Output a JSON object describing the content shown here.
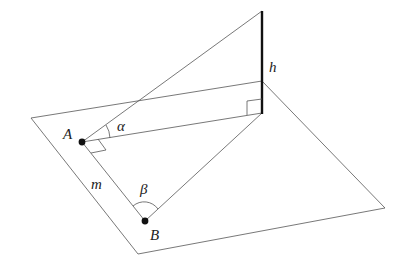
{
  "diagram": {
    "type": "3d-geometry",
    "labels": {
      "point_a": "A",
      "point_b": "B",
      "height": "h",
      "distance_ab": "m",
      "angle_alpha": "α",
      "angle_beta": "β"
    },
    "right_angles": [
      "at A between AB and A-foot",
      "at foot of vertical segment"
    ]
  }
}
